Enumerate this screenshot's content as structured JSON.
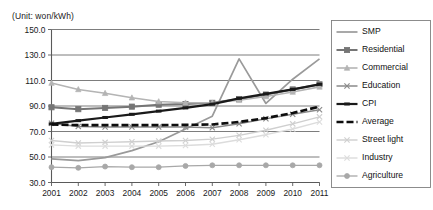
{
  "unit_label": "(Unit: won/kWh)",
  "chart_data": {
    "type": "line",
    "title": "",
    "subtitle": "",
    "xlabel": "",
    "ylabel": "",
    "unit": "won/kWh",
    "grid": true,
    "legend_position": "right",
    "ylim": [
      30.0,
      150.0
    ],
    "ytick_step": 20.0,
    "yticks": [
      "150.0",
      "130.0",
      "110.0",
      "90.0",
      "70.0",
      "50.0",
      "30.0"
    ],
    "ytick_values": [
      150.0,
      130.0,
      110.0,
      90.0,
      70.0,
      50.0,
      30.0
    ],
    "categories": [
      "2001",
      "2002",
      "2003",
      "2004",
      "2005",
      "2006",
      "2007",
      "2008",
      "2009",
      "2010",
      "2011"
    ],
    "x": [
      2001,
      2002,
      2003,
      2004,
      2005,
      2006,
      2007,
      2008,
      2009,
      2010,
      2011
    ],
    "series": [
      {
        "name": "SMP",
        "color": "#9a9a9a",
        "marker": "none",
        "dash": "none",
        "width": 1.7,
        "values": [
          48.6,
          47.2,
          49.5,
          55.0,
          62.0,
          72.0,
          82.0,
          127.0,
          92.0,
          111.0,
          127.0
        ]
      },
      {
        "name": "Residential",
        "color": "#757575",
        "marker": "square",
        "dash": "none",
        "width": 2.0,
        "values": [
          89.0,
          87.5,
          88.5,
          89.5,
          91.0,
          91.5,
          92.5,
          95.5,
          99.0,
          103.0,
          107.0
        ]
      },
      {
        "name": "Commercial",
        "color": "#b4b4b4",
        "marker": "triangle",
        "dash": "none",
        "width": 1.6,
        "values": [
          108.0,
          103.0,
          100.0,
          96.5,
          93.5,
          92.5,
          92.5,
          94.5,
          97.5,
          101.0,
          105.0
        ]
      },
      {
        "name": "Education",
        "color": "#8a8a8a",
        "marker": "x",
        "dash": "none",
        "width": 1.5,
        "values": [
          76.5,
          74.0,
          73.5,
          73.5,
          73.5,
          73.5,
          73.0,
          76.0,
          80.0,
          83.5,
          87.0
        ]
      },
      {
        "name": "CPI",
        "color": "#1a1a1a",
        "marker": "dash",
        "dash": "none",
        "width": 2.2,
        "values": [
          76.0,
          78.5,
          81.0,
          83.5,
          86.0,
          88.5,
          91.5,
          96.0,
          99.5,
          103.0,
          107.0
        ]
      },
      {
        "name": "Average",
        "color": "#0d0d0d",
        "marker": "none",
        "dash": "7 3",
        "width": 2.6,
        "values": [
          75.5,
          75.0,
          75.0,
          75.0,
          75.0,
          75.2,
          75.5,
          77.5,
          80.5,
          84.5,
          89.5
        ]
      },
      {
        "name": "Street light",
        "color": "#cfcfcf",
        "marker": "x",
        "dash": "none",
        "width": 1.4,
        "values": [
          63.0,
          61.0,
          61.5,
          62.0,
          62.5,
          63.0,
          64.0,
          67.0,
          71.0,
          76.0,
          81.5
        ]
      },
      {
        "name": "Industry",
        "color": "#dcdcdc",
        "marker": "x",
        "dash": "none",
        "width": 1.4,
        "values": [
          59.5,
          58.5,
          58.5,
          58.5,
          58.5,
          59.0,
          60.0,
          63.5,
          67.5,
          72.0,
          77.5
        ]
      },
      {
        "name": "Agriculture",
        "color": "#a8a8a8",
        "marker": "circle",
        "dash": "none",
        "width": 1.3,
        "values": [
          42.0,
          41.5,
          42.5,
          42.0,
          42.0,
          43.0,
          43.5,
          43.5,
          43.5,
          43.5,
          43.5
        ]
      }
    ]
  },
  "legend": {
    "items": [
      {
        "label": "SMP"
      },
      {
        "label": "Residential"
      },
      {
        "label": "Commercial"
      },
      {
        "label": "Education"
      },
      {
        "label": "CPI"
      },
      {
        "label": "Average"
      },
      {
        "label": "Street light"
      },
      {
        "label": "Industry"
      },
      {
        "label": "Agriculture"
      }
    ]
  }
}
